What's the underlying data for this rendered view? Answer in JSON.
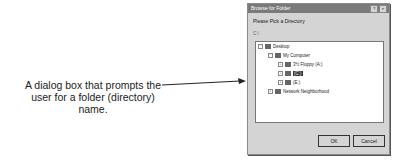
{
  "caption": "A dialog box that prompts the user for a folder (directory) name.",
  "dialog": {
    "title": "Browse for Folder",
    "help_button": "?",
    "close_button": "×",
    "prompt": "Please Pick a Directory",
    "current_path": "C:\\",
    "tree": {
      "root": "Desktop",
      "my_computer": "My Computer",
      "drives": [
        "3½ Floppy (A:)",
        "(C:)",
        "(E:)"
      ],
      "selected": "(C:)",
      "network": "Network Neighborhood"
    },
    "ok_label": "OK",
    "cancel_label": "Cancel"
  }
}
